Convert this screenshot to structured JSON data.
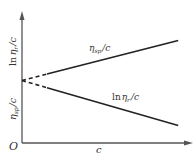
{
  "chart_data": {
    "type": "line",
    "title": "",
    "xlabel": "c",
    "ylabel_upper": "ln ηr /c",
    "ylabel_lower": "ηsp /c",
    "origin_label": "O",
    "grid": false,
    "series": [
      {
        "name": "ηsp/c",
        "label_main": "η",
        "label_sub": "sp",
        "label_suffix": "/c",
        "trend": "increasing",
        "extrapolated_segment": "dashed",
        "x": [
          0,
          1
        ],
        "y": [
          0.5,
          0.82
        ]
      },
      {
        "name": "ln ηr/c",
        "label_prefix": "ln",
        "label_main": "η",
        "label_sub": "r",
        "label_suffix": "/c",
        "trend": "decreasing",
        "extrapolated_segment": "dashed",
        "x": [
          0,
          1
        ],
        "y": [
          0.5,
          0.14
        ]
      }
    ],
    "intercept_note": "both lines extrapolate to the same intercept on the y-axis at c = 0",
    "xlim": [
      0,
      1.05
    ],
    "ylim": [
      0,
      1
    ]
  }
}
